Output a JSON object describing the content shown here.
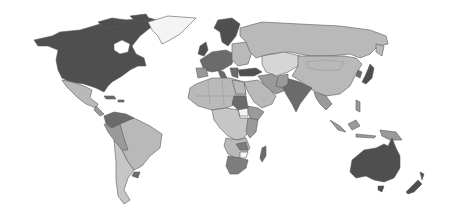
{
  "map": {
    "type": "choropleth",
    "projection": "world",
    "style": "grayscale",
    "legend": null,
    "title": null,
    "shades": {
      "darkest": "#4f4f4f",
      "dark": "#6b6b6b",
      "medium": "#9a9a9a",
      "light": "#b9b9b9",
      "lightest": "#d6d6d6",
      "white": "#f4f4f4",
      "outline": "#5a5a5a"
    },
    "regions": [
      {
        "name": "North America (USA/Canada)",
        "shade": "darkest"
      },
      {
        "name": "Greenland",
        "shade": "white"
      },
      {
        "name": "Mexico",
        "shade": "light"
      },
      {
        "name": "Central America",
        "shade": "medium"
      },
      {
        "name": "Colombia/Venezuela",
        "shade": "dark"
      },
      {
        "name": "Brazil",
        "shade": "light"
      },
      {
        "name": "Peru/Bolivia",
        "shade": "medium"
      },
      {
        "name": "Argentina/Chile",
        "shade": "light"
      },
      {
        "name": "Uruguay",
        "shade": "dark"
      },
      {
        "name": "Western Europe",
        "shade": "dark"
      },
      {
        "name": "Scandinavia",
        "shade": "darkest"
      },
      {
        "name": "Eastern Europe",
        "shade": "light"
      },
      {
        "name": "Russia",
        "shade": "light"
      },
      {
        "name": "Central Asia",
        "shade": "lightest"
      },
      {
        "name": "China",
        "shade": "light"
      },
      {
        "name": "Turkey",
        "shade": "darkest"
      },
      {
        "name": "Middle East",
        "shade": "light"
      },
      {
        "name": "India",
        "shade": "dark"
      },
      {
        "name": "Southeast Asia",
        "shade": "medium"
      },
      {
        "name": "Japan",
        "shade": "darkest"
      },
      {
        "name": "North Africa",
        "shade": "light"
      },
      {
        "name": "Sudan",
        "shade": "dark"
      },
      {
        "name": "South Sudan",
        "shade": "white"
      },
      {
        "name": "Central/East Africa",
        "shade": "light"
      },
      {
        "name": "Ethiopia/Kenya",
        "shade": "medium"
      },
      {
        "name": "Southern Africa",
        "shade": "medium"
      },
      {
        "name": "South Africa",
        "shade": "dark"
      },
      {
        "name": "Madagascar",
        "shade": "dark"
      },
      {
        "name": "Indonesia",
        "shade": "medium"
      },
      {
        "name": "Papua New Guinea",
        "shade": "medium"
      },
      {
        "name": "Australia",
        "shade": "darkest"
      },
      {
        "name": "New Zealand",
        "shade": "darkest"
      }
    ]
  }
}
